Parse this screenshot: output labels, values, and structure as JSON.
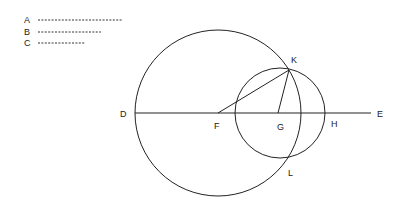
{
  "legend": [
    {
      "label": "A",
      "x": 27,
      "y": 20,
      "x1": 38,
      "x2": 122
    },
    {
      "label": "B",
      "x": 27,
      "y": 32,
      "x1": 38,
      "x2": 101
    },
    {
      "label": "C",
      "x": 27,
      "y": 43,
      "x1": 38,
      "x2": 85
    }
  ],
  "labels": {
    "D": "D",
    "E": "E",
    "F": "F",
    "G": "G",
    "H": "H",
    "K": "K",
    "L": "L"
  },
  "geometry": {
    "line_DE": {
      "x1": 135,
      "y1": 113,
      "x2": 371,
      "y2": 113
    },
    "circle_F": {
      "cx": 218,
      "cy": 113,
      "r": 83
    },
    "circle_G": {
      "cx": 280,
      "cy": 113,
      "r": 45
    },
    "segment_FK": {
      "x1": 218,
      "y1": 113,
      "x2": 289,
      "y2": 70
    },
    "segment_GK": {
      "x1": 278,
      "y1": 113,
      "x2": 289,
      "y2": 70
    }
  },
  "stroke_color": "#222222"
}
